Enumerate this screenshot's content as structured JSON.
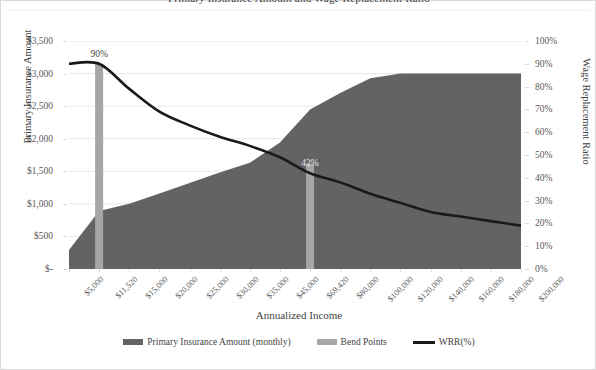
{
  "chart_title": "Primary Insurance Amount and Wage Replacement Ratio",
  "axes": {
    "x_title": "Annualized Income",
    "y_left_title": "Primary Insurance Amount",
    "y_right_title": "Wage Replacement Ratio",
    "y_left_ticks": [
      "$3,500",
      "$3,000",
      "$2,500",
      "$2,000",
      "$1,500",
      "$1,000",
      "$500",
      "$-"
    ],
    "y_right_ticks": [
      "100%",
      "90%",
      "80%",
      "70%",
      "60%",
      "50%",
      "40%",
      "30%",
      "20%",
      "10%",
      "0%"
    ]
  },
  "legend": {
    "items": [
      {
        "label": "Primary Insurance Amount (monthly)",
        "color": "#636363",
        "marker": "area"
      },
      {
        "label": "Bend Points",
        "color": "#a6a6a6",
        "marker": "area"
      },
      {
        "label": "WRR(%)",
        "color": "#1a1a1a",
        "marker": "line"
      }
    ]
  },
  "chart_data": {
    "type": "area",
    "title": "Primary Insurance Amount and Wage Replacement Ratio",
    "xlabel": "Annualized Income",
    "ylabel": "Primary Insurance Amount",
    "y2label": "Wage Replacement Ratio",
    "grid": true,
    "legend_position": "bottom",
    "categories": [
      "$5,000",
      "$11,520",
      "$15,000",
      "$20,000",
      "$25,000",
      "$30,000",
      "$35,000",
      "$45,000",
      "$69,420",
      "$80,000",
      "$100,000",
      "$120,000",
      "$140,000",
      "$160,000",
      "$180,000",
      "$200,000"
    ],
    "ylim": [
      0,
      3500
    ],
    "y2lim": [
      0,
      100
    ],
    "series": [
      {
        "name": "Primary Insurance Amount (monthly)",
        "type": "area",
        "axis": "left",
        "color": "#636363",
        "values": [
          290,
          890,
          1000,
          1160,
          1320,
          1480,
          1630,
          1940,
          2450,
          2700,
          2930,
          3000,
          3000,
          3000,
          3000,
          3000
        ]
      },
      {
        "name": "Bend Points",
        "type": "bar",
        "axis": "left",
        "color": "#a6a6a6",
        "values": [
          0,
          3150,
          0,
          0,
          0,
          0,
          0,
          0,
          1620,
          0,
          0,
          0,
          0,
          0,
          0,
          0
        ]
      },
      {
        "name": "WRR(%)",
        "type": "line",
        "axis": "right",
        "color": "#1a1a1a",
        "values": [
          90,
          90,
          79,
          69,
          63,
          58,
          54,
          49,
          42,
          38,
          33,
          29,
          25,
          23,
          21,
          19
        ]
      }
    ],
    "annotations": [
      {
        "text": "90%",
        "category": "$11,520",
        "value": 90,
        "axis": "right",
        "color": "#3f3f3f"
      },
      {
        "text": "42%",
        "category": "$69,420",
        "value": 42,
        "axis": "right",
        "color": "#e6e6e6"
      }
    ]
  }
}
